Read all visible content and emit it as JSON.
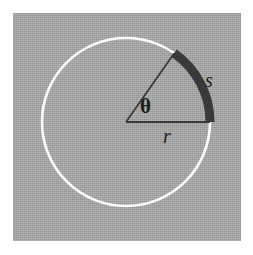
{
  "figure": {
    "panel": {
      "background_color": "#a3a3a3",
      "border_color": "#ffffff"
    },
    "circle": {
      "name": "circle-outline",
      "center_x": 126,
      "center_y": 122,
      "radius": 84,
      "stroke_color": "#ffffff",
      "stroke_width": 2.6
    },
    "arc": {
      "name": "arc-s",
      "start_angle_deg": 55,
      "end_angle_deg": 0,
      "stroke_color": "#3a3a3a",
      "stroke_width": 9
    },
    "radii": [
      {
        "name": "radius-horizontal",
        "from_x": 126,
        "from_y": 122,
        "to_x": 210,
        "to_y": 122,
        "stroke_color": "#3a3a3a",
        "stroke_width": 1.8
      },
      {
        "name": "radius-angled",
        "from_x": 126,
        "from_y": 122,
        "to_x": 174,
        "to_y": 53,
        "stroke_color": "#3a3a3a",
        "stroke_width": 1.8
      }
    ],
    "labels": {
      "theta": "θ",
      "radius": "r",
      "arc_length": "s"
    }
  }
}
